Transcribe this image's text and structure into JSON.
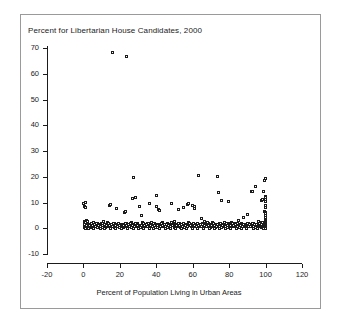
{
  "figure": {
    "title": "Percent for Libertarian House Candidates, 2000",
    "xaxis_label": "Percent of Population Living in Urban Areas"
  },
  "chart_data": {
    "type": "scatter",
    "title": "Percent for Libertarian House Candidates, 2000",
    "xlabel": "Percent of Population Living in Urban Areas",
    "ylabel": "Percent for Libertarian House Candidates, 2000",
    "xlim": [
      -20,
      120
    ],
    "ylim": [
      -10,
      70
    ],
    "xticks": [
      -20,
      0,
      20,
      40,
      60,
      80,
      100,
      120
    ],
    "yticks": [
      -10,
      0,
      10,
      20,
      30,
      40,
      50,
      60,
      70
    ],
    "grid": false,
    "legend": null,
    "marker": "open-square",
    "marker_color": "#1b1b1b",
    "points": [
      [
        0.5,
        9.6
      ],
      [
        0.8,
        8.2
      ],
      [
        1.2,
        9.9
      ],
      [
        1.4,
        7.9
      ],
      [
        1.0,
        2.6
      ],
      [
        1.6,
        2.1
      ],
      [
        0.6,
        1.3
      ],
      [
        1.9,
        0.9
      ],
      [
        2.4,
        1.7
      ],
      [
        2.8,
        0.4
      ],
      [
        3.4,
        1.1
      ],
      [
        3.9,
        0.2
      ],
      [
        4.5,
        1.5
      ],
      [
        5.1,
        0.7
      ],
      [
        5.6,
        2.0
      ],
      [
        6.2,
        0.3
      ],
      [
        6.8,
        1.2
      ],
      [
        7.3,
        0.6
      ],
      [
        7.9,
        1.8
      ],
      [
        8.4,
        0.1
      ],
      [
        9.0,
        1.0
      ],
      [
        9.6,
        0.5
      ],
      [
        10.2,
        1.6
      ],
      [
        10.8,
        0.2
      ],
      [
        11.3,
        2.3
      ],
      [
        11.9,
        0.8
      ],
      [
        12.5,
        1.1
      ],
      [
        13.1,
        0.4
      ],
      [
        13.7,
        1.9
      ],
      [
        14.2,
        0.6
      ],
      [
        14.8,
        8.7
      ],
      [
        15.4,
        8.9
      ],
      [
        15.9,
        1.2
      ],
      [
        16.1,
        68.2
      ],
      [
        16.5,
        0.3
      ],
      [
        17.1,
        1.5
      ],
      [
        17.7,
        0.9
      ],
      [
        18.3,
        7.5
      ],
      [
        18.8,
        0.5
      ],
      [
        19.4,
        1.7
      ],
      [
        20.0,
        0.2
      ],
      [
        20.6,
        1.0
      ],
      [
        21.2,
        0.7
      ],
      [
        21.8,
        1.4
      ],
      [
        22.3,
        0.1
      ],
      [
        22.9,
        5.9
      ],
      [
        23.5,
        6.2
      ],
      [
        24.0,
        66.4
      ],
      [
        24.1,
        1.8
      ],
      [
        24.7,
        0.6
      ],
      [
        25.3,
        1.1
      ],
      [
        25.9,
        0.3
      ],
      [
        26.4,
        2.1
      ],
      [
        27.0,
        0.8
      ],
      [
        27.4,
        11.2
      ],
      [
        27.6,
        19.7
      ],
      [
        28.2,
        1.3
      ],
      [
        28.8,
        0.4
      ],
      [
        29.0,
        11.9
      ],
      [
        29.4,
        0.9
      ],
      [
        30.0,
        1.6
      ],
      [
        30.5,
        0.2
      ],
      [
        30.8,
        8.1
      ],
      [
        31.1,
        1.0
      ],
      [
        31.7,
        0.5
      ],
      [
        32.3,
        4.6
      ],
      [
        32.9,
        1.9
      ],
      [
        33.4,
        0.7
      ],
      [
        34.0,
        1.2
      ],
      [
        34.6,
        0.3
      ],
      [
        35.2,
        1.5
      ],
      [
        35.8,
        0.8
      ],
      [
        36.3,
        9.5
      ],
      [
        36.9,
        0.4
      ],
      [
        37.5,
        2.2
      ],
      [
        38.1,
        1.0
      ],
      [
        38.6,
        0.6
      ],
      [
        39.2,
        1.7
      ],
      [
        39.8,
        0.2
      ],
      [
        40.4,
        12.6
      ],
      [
        40.6,
        8.4
      ],
      [
        41.0,
        1.1
      ],
      [
        41.5,
        7.2
      ],
      [
        41.9,
        6.6
      ],
      [
        42.1,
        0.9
      ],
      [
        42.7,
        1.4
      ],
      [
        43.3,
        0.5
      ],
      [
        43.9,
        2.0
      ],
      [
        44.4,
        0.7
      ],
      [
        45.0,
        1.3
      ],
      [
        45.6,
        0.1
      ],
      [
        46.2,
        1.8
      ],
      [
        46.8,
        0.6
      ],
      [
        47.3,
        1.0
      ],
      [
        47.9,
        0.3
      ],
      [
        48.5,
        9.3
      ],
      [
        49.1,
        1.5
      ],
      [
        49.6,
        0.8
      ],
      [
        50.2,
        2.4
      ],
      [
        50.8,
        0.4
      ],
      [
        51.4,
        1.2
      ],
      [
        52.0,
        0.9
      ],
      [
        52.5,
        7.1
      ],
      [
        53.1,
        1.6
      ],
      [
        53.7,
        0.2
      ],
      [
        54.3,
        1.0
      ],
      [
        54.8,
        0.7
      ],
      [
        55.4,
        8.0
      ],
      [
        56.0,
        1.3
      ],
      [
        56.6,
        0.5
      ],
      [
        57.2,
        9.1
      ],
      [
        57.7,
        1.9
      ],
      [
        58.0,
        9.3
      ],
      [
        58.3,
        0.8
      ],
      [
        58.9,
        1.1
      ],
      [
        59.5,
        0.3
      ],
      [
        60.1,
        8.8
      ],
      [
        60.6,
        1.7
      ],
      [
        61.2,
        8.2
      ],
      [
        61.5,
        7.4
      ],
      [
        61.8,
        0.6
      ],
      [
        62.4,
        1.4
      ],
      [
        63.0,
        0.2
      ],
      [
        63.5,
        20.1
      ],
      [
        64.1,
        1.0
      ],
      [
        64.7,
        0.9
      ],
      [
        65.3,
        3.4
      ],
      [
        65.9,
        1.5
      ],
      [
        66.4,
        0.4
      ],
      [
        67.0,
        2.6
      ],
      [
        67.6,
        1.1
      ],
      [
        68.2,
        0.7
      ],
      [
        68.7,
        1.8
      ],
      [
        69.3,
        0.3
      ],
      [
        69.9,
        1.2
      ],
      [
        70.5,
        0.6
      ],
      [
        71.1,
        2.0
      ],
      [
        71.6,
        0.9
      ],
      [
        72.2,
        1.4
      ],
      [
        72.8,
        0.2
      ],
      [
        73.4,
        1.0
      ],
      [
        74.0,
        20.0
      ],
      [
        74.2,
        0.5
      ],
      [
        74.5,
        13.8
      ],
      [
        74.8,
        1.6
      ],
      [
        75.4,
        0.8
      ],
      [
        76.0,
        10.6
      ],
      [
        76.5,
        1.2
      ],
      [
        77.1,
        0.4
      ],
      [
        77.7,
        1.9
      ],
      [
        78.3,
        0.7
      ],
      [
        78.9,
        1.3
      ],
      [
        79.4,
        0.1
      ],
      [
        80.0,
        10.3
      ],
      [
        80.2,
        1.5
      ],
      [
        80.8,
        0.6
      ],
      [
        81.4,
        2.2
      ],
      [
        82.0,
        1.0
      ],
      [
        82.5,
        0.3
      ],
      [
        83.1,
        1.7
      ],
      [
        83.7,
        0.8
      ],
      [
        84.3,
        1.1
      ],
      [
        84.9,
        0.5
      ],
      [
        85.4,
        2.8
      ],
      [
        86.0,
        1.3
      ],
      [
        86.6,
        0.2
      ],
      [
        87.2,
        1.6
      ],
      [
        87.8,
        0.9
      ],
      [
        88.3,
        4.0
      ],
      [
        88.9,
        1.2
      ],
      [
        89.5,
        0.6
      ],
      [
        90.1,
        5.2
      ],
      [
        90.7,
        1.8
      ],
      [
        91.2,
        0.4
      ],
      [
        91.8,
        1.0
      ],
      [
        92.4,
        14.2
      ],
      [
        92.8,
        0.7
      ],
      [
        93.0,
        14.0
      ],
      [
        93.4,
        1.5
      ],
      [
        94.0,
        0.3
      ],
      [
        94.6,
        16.0
      ],
      [
        95.1,
        1.1
      ],
      [
        95.7,
        0.8
      ],
      [
        96.3,
        2.4
      ],
      [
        96.9,
        1.3
      ],
      [
        97.5,
        0.5
      ],
      [
        98.0,
        10.4
      ],
      [
        98.3,
        1.9
      ],
      [
        98.6,
        11.1
      ],
      [
        99.0,
        0.9
      ],
      [
        99.2,
        13.9
      ],
      [
        99.4,
        1.4
      ],
      [
        99.6,
        0.2
      ],
      [
        99.8,
        18.2
      ],
      [
        99.9,
        6.4
      ],
      [
        100.0,
        19.0
      ],
      [
        100.0,
        12.1
      ],
      [
        100.0,
        11.6
      ],
      [
        100.0,
        10.9
      ],
      [
        100.0,
        10.2
      ],
      [
        100.0,
        8.6
      ],
      [
        100.0,
        7.9
      ],
      [
        100.0,
        6.1
      ],
      [
        100.0,
        5.4
      ],
      [
        100.0,
        4.7
      ],
      [
        100.0,
        4.0
      ],
      [
        100.0,
        3.3
      ],
      [
        100.0,
        2.8
      ],
      [
        100.0,
        2.3
      ],
      [
        100.0,
        1.9
      ],
      [
        100.0,
        1.5
      ],
      [
        100.0,
        1.1
      ],
      [
        100.0,
        0.8
      ],
      [
        100.0,
        0.5
      ],
      [
        100.0,
        0.2
      ],
      [
        100.0,
        -0.1
      ],
      [
        100.0,
        -0.4
      ],
      [
        99.7,
        1.0
      ],
      [
        99.5,
        2.0
      ],
      [
        99.3,
        0.4
      ],
      [
        99.1,
        1.6
      ],
      [
        98.8,
        0.7
      ],
      [
        98.5,
        2.2
      ],
      [
        98.2,
        0.1
      ],
      [
        97.9,
        1.2
      ],
      [
        97.6,
        0.6
      ],
      [
        97.2,
        1.7
      ],
      [
        96.8,
        0.3
      ],
      [
        96.5,
        1.0
      ],
      [
        96.0,
        0.8
      ],
      [
        95.5,
        1.4
      ],
      [
        95.0,
        0.2
      ],
      [
        94.4,
        1.1
      ],
      [
        93.8,
        0.5
      ],
      [
        93.2,
        1.8
      ],
      [
        92.6,
        0.9
      ],
      [
        92.0,
        0.3
      ],
      [
        91.5,
        1.3
      ],
      [
        90.9,
        0.6
      ],
      [
        90.3,
        1.6
      ],
      [
        89.8,
        0.2
      ],
      [
        89.2,
        1.0
      ],
      [
        88.6,
        0.7
      ],
      [
        88.0,
        1.4
      ],
      [
        87.5,
        0.4
      ],
      [
        86.9,
        1.1
      ],
      [
        86.3,
        0.8
      ],
      [
        85.7,
        0.1
      ],
      [
        85.1,
        1.5
      ],
      [
        84.6,
        0.6
      ],
      [
        84.0,
        1.2
      ],
      [
        83.4,
        0.3
      ],
      [
        82.8,
        0.9
      ],
      [
        82.2,
        1.6
      ],
      [
        81.7,
        0.5
      ],
      [
        81.1,
        1.0
      ],
      [
        80.5,
        0.2
      ],
      [
        79.9,
        1.3
      ],
      [
        79.2,
        0.7
      ],
      [
        78.6,
        1.8
      ],
      [
        78.0,
        0.4
      ],
      [
        77.4,
        1.1
      ],
      [
        76.8,
        0.8
      ],
      [
        76.2,
        0.1
      ],
      [
        75.7,
        1.5
      ],
      [
        75.1,
        0.6
      ],
      [
        73.7,
        1.2
      ],
      [
        73.1,
        0.3
      ],
      [
        72.5,
        0.9
      ],
      [
        71.9,
        1.7
      ],
      [
        71.3,
        0.5
      ],
      [
        70.8,
        1.0
      ],
      [
        70.2,
        0.2
      ],
      [
        69.6,
        1.3
      ],
      [
        69.0,
        0.7
      ],
      [
        68.4,
        1.9
      ],
      [
        67.8,
        0.4
      ],
      [
        67.3,
        1.1
      ],
      [
        66.7,
        0.8
      ],
      [
        66.1,
        0.1
      ],
      [
        65.6,
        1.4
      ],
      [
        65.0,
        0.6
      ],
      [
        64.4,
        1.2
      ],
      [
        63.8,
        0.3
      ],
      [
        63.2,
        0.9
      ],
      [
        62.7,
        1.6
      ],
      [
        62.1,
        0.5
      ],
      [
        61.0,
        1.0
      ],
      [
        60.4,
        0.2
      ],
      [
        59.8,
        1.3
      ],
      [
        59.2,
        0.7
      ],
      [
        58.6,
        1.8
      ],
      [
        57.4,
        0.4
      ],
      [
        56.9,
        1.1
      ],
      [
        56.3,
        0.8
      ],
      [
        55.7,
        0.1
      ],
      [
        55.1,
        1.5
      ],
      [
        54.5,
        0.6
      ],
      [
        54.0,
        1.2
      ],
      [
        53.4,
        0.3
      ],
      [
        52.8,
        0.9
      ],
      [
        52.2,
        1.7
      ],
      [
        51.7,
        0.5
      ],
      [
        51.1,
        1.0
      ],
      [
        50.5,
        0.2
      ],
      [
        49.9,
        1.3
      ],
      [
        49.3,
        0.7
      ],
      [
        48.8,
        1.9
      ],
      [
        48.2,
        0.4
      ],
      [
        47.6,
        1.1
      ],
      [
        47.0,
        0.8
      ],
      [
        46.5,
        0.1
      ],
      [
        45.9,
        1.4
      ],
      [
        45.3,
        0.6
      ],
      [
        44.7,
        1.2
      ],
      [
        44.1,
        0.3
      ],
      [
        43.6,
        0.9
      ],
      [
        43.0,
        1.6
      ],
      [
        42.4,
        0.5
      ],
      [
        41.2,
        1.0
      ],
      [
        40.7,
        0.2
      ],
      [
        40.1,
        1.3
      ],
      [
        39.5,
        0.7
      ],
      [
        38.9,
        1.8
      ],
      [
        38.3,
        0.4
      ],
      [
        37.8,
        1.1
      ],
      [
        37.2,
        0.8
      ],
      [
        36.6,
        0.1
      ],
      [
        36.0,
        1.5
      ],
      [
        35.5,
        0.6
      ],
      [
        34.9,
        1.2
      ],
      [
        34.3,
        0.3
      ],
      [
        33.7,
        0.9
      ],
      [
        33.1,
        1.6
      ],
      [
        32.6,
        0.5
      ],
      [
        32.0,
        1.0
      ],
      [
        31.4,
        0.2
      ],
      [
        30.2,
        1.3
      ],
      [
        29.7,
        0.7
      ],
      [
        29.1,
        1.8
      ],
      [
        28.5,
        0.4
      ],
      [
        27.9,
        1.1
      ],
      [
        27.3,
        0.8
      ],
      [
        26.7,
        0.1
      ],
      [
        26.1,
        1.5
      ],
      [
        25.6,
        0.6
      ],
      [
        25.0,
        1.2
      ],
      [
        24.4,
        0.3
      ],
      [
        23.8,
        0.9
      ],
      [
        23.2,
        1.6
      ],
      [
        22.6,
        0.5
      ],
      [
        22.1,
        1.0
      ],
      [
        21.5,
        0.2
      ],
      [
        20.9,
        1.3
      ],
      [
        20.3,
        0.7
      ],
      [
        19.7,
        1.8
      ],
      [
        19.1,
        0.4
      ],
      [
        18.5,
        1.1
      ],
      [
        18.0,
        0.8
      ],
      [
        17.4,
        0.1
      ],
      [
        16.8,
        1.5
      ],
      [
        16.2,
        0.6
      ],
      [
        15.6,
        1.2
      ],
      [
        15.1,
        0.3
      ],
      [
        14.5,
        0.9
      ],
      [
        13.9,
        1.6
      ],
      [
        13.3,
        0.5
      ],
      [
        12.8,
        1.0
      ],
      [
        12.2,
        0.2
      ],
      [
        11.6,
        1.3
      ],
      [
        11.0,
        0.7
      ],
      [
        10.5,
        1.8
      ],
      [
        9.9,
        0.4
      ],
      [
        9.3,
        1.1
      ],
      [
        8.7,
        0.8
      ],
      [
        8.1,
        0.1
      ],
      [
        7.6,
        1.5
      ],
      [
        7.0,
        0.6
      ],
      [
        6.4,
        1.2
      ],
      [
        5.8,
        0.3
      ],
      [
        5.3,
        0.9
      ],
      [
        4.7,
        1.6
      ],
      [
        4.1,
        0.5
      ],
      [
        3.5,
        1.0
      ],
      [
        3.0,
        0.2
      ],
      [
        2.4,
        1.3
      ],
      [
        1.8,
        0.7
      ],
      [
        2.1,
        2.9
      ],
      [
        2.6,
        2.4
      ],
      [
        0.9,
        0.0
      ],
      [
        1.5,
        -0.3
      ],
      [
        3.2,
        -0.2
      ],
      [
        6.0,
        -0.4
      ],
      [
        9.5,
        -0.1
      ],
      [
        12.0,
        -0.3
      ],
      [
        15.0,
        -0.2
      ],
      [
        18.0,
        -0.4
      ],
      [
        21.0,
        -0.1
      ],
      [
        24.5,
        -0.3
      ],
      [
        27.5,
        -0.2
      ],
      [
        30.5,
        -0.4
      ],
      [
        33.5,
        -0.1
      ],
      [
        36.5,
        -0.3
      ],
      [
        39.0,
        -0.2
      ],
      [
        42.0,
        -0.4
      ],
      [
        45.5,
        -0.1
      ],
      [
        48.0,
        -0.3
      ],
      [
        51.0,
        -0.2
      ],
      [
        54.2,
        -0.4
      ],
      [
        57.0,
        -0.1
      ],
      [
        60.0,
        -0.3
      ],
      [
        63.0,
        -0.2
      ],
      [
        66.0,
        -0.4
      ],
      [
        69.5,
        -0.1
      ],
      [
        72.0,
        -0.3
      ],
      [
        75.0,
        -0.2
      ],
      [
        78.5,
        -0.4
      ],
      [
        81.0,
        -0.1
      ],
      [
        84.5,
        -0.3
      ],
      [
        87.0,
        -0.2
      ],
      [
        90.0,
        -0.4
      ],
      [
        93.5,
        -0.1
      ],
      [
        96.0,
        -0.3
      ],
      [
        99.0,
        -0.2
      ]
    ]
  },
  "axes": {
    "y_tick_labels": [
      "70",
      "60",
      "50",
      "40",
      "30",
      "20",
      "10",
      "0",
      "-10"
    ],
    "x_tick_labels": [
      "-20",
      "0",
      "20",
      "40",
      "60",
      "80",
      "100",
      "120"
    ]
  }
}
